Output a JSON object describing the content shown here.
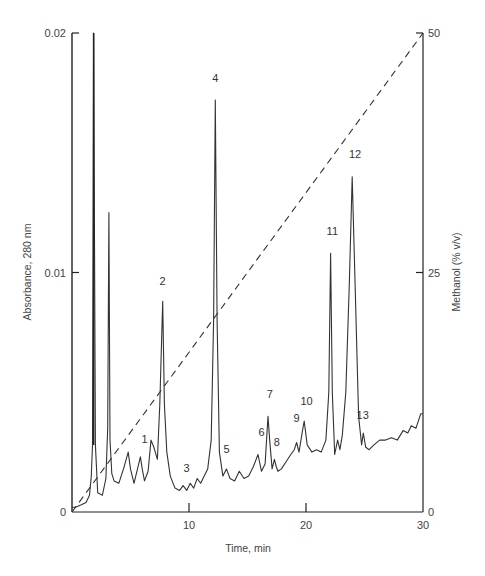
{
  "chart_data": {
    "type": "line",
    "title": "",
    "xlabel": "Time, min",
    "ylabel": "Absorbance, 280 nm",
    "y2label": "Methanol (% v/v)",
    "xlim": [
      0,
      30
    ],
    "ylim": [
      0,
      0.02
    ],
    "y2lim": [
      0,
      50
    ],
    "grid": false,
    "x_ticks": [
      {
        "value": 10,
        "label": "10"
      },
      {
        "value": 20,
        "label": "20"
      },
      {
        "value": 30,
        "label": "30"
      }
    ],
    "y_ticks": [
      {
        "value": 0,
        "label": "0"
      },
      {
        "value": 0.01,
        "label": "0.01"
      },
      {
        "value": 0.02,
        "label": "0.02"
      }
    ],
    "y2_ticks": [
      {
        "value": 0,
        "label": "0"
      },
      {
        "value": 25,
        "label": "25"
      },
      {
        "value": 50,
        "label": "50"
      }
    ],
    "series": [
      {
        "name": "Absorbance 280 nm",
        "style": "solid",
        "axis": "left",
        "x": [
          0,
          0.3,
          0.8,
          1.2,
          1.5,
          1.65,
          1.75,
          1.85,
          2.0,
          2.2,
          2.6,
          2.9,
          3.05,
          3.15,
          3.25,
          3.4,
          3.6,
          4.0,
          4.4,
          4.8,
          5.0,
          5.3,
          5.6,
          5.85,
          6.0,
          6.2,
          6.5,
          6.75,
          7.0,
          7.3,
          7.5,
          7.75,
          7.9,
          8.1,
          8.4,
          8.8,
          9.2,
          9.5,
          9.8,
          10.1,
          10.4,
          10.7,
          11.0,
          11.3,
          11.6,
          11.9,
          12.1,
          12.25,
          12.4,
          12.6,
          12.9,
          13.2,
          13.5,
          13.9,
          14.3,
          14.7,
          15.1,
          15.5,
          15.9,
          16.2,
          16.5,
          16.75,
          16.9,
          17.1,
          17.3,
          17.45,
          17.6,
          17.9,
          18.3,
          18.7,
          19.0,
          19.2,
          19.4,
          19.7,
          19.85,
          20.1,
          20.5,
          20.9,
          21.3,
          21.7,
          21.95,
          22.1,
          22.25,
          22.45,
          22.7,
          22.9,
          23.1,
          23.4,
          23.7,
          23.95,
          24.2,
          24.5,
          24.75,
          24.9,
          25.1,
          25.4,
          25.8,
          26.3,
          26.8,
          27.3,
          27.8,
          28.3,
          28.7,
          29.0,
          29.4,
          29.8,
          30.0
        ],
        "values": [
          0.0002,
          0.0002,
          0.0003,
          0.0004,
          0.0007,
          0.0015,
          0.0028,
          0.02,
          0.0028,
          0.0008,
          0.0007,
          0.0014,
          0.0035,
          0.0125,
          0.003,
          0.0016,
          0.0013,
          0.0012,
          0.0018,
          0.0025,
          0.0018,
          0.0012,
          0.0018,
          0.0023,
          0.0018,
          0.0013,
          0.0017,
          0.003,
          0.0027,
          0.0022,
          0.0045,
          0.0088,
          0.0045,
          0.0025,
          0.0015,
          0.001,
          0.0009,
          0.0011,
          0.0009,
          0.0012,
          0.001,
          0.0014,
          0.0012,
          0.0015,
          0.0018,
          0.003,
          0.008,
          0.0172,
          0.008,
          0.0025,
          0.0015,
          0.0018,
          0.0014,
          0.0013,
          0.0017,
          0.0014,
          0.0015,
          0.0019,
          0.0024,
          0.0017,
          0.002,
          0.004,
          0.003,
          0.0018,
          0.0022,
          0.0019,
          0.0017,
          0.0018,
          0.0021,
          0.0024,
          0.0026,
          0.0029,
          0.0025,
          0.0034,
          0.0038,
          0.0028,
          0.0025,
          0.0026,
          0.0025,
          0.003,
          0.005,
          0.0108,
          0.005,
          0.0024,
          0.003,
          0.0026,
          0.0032,
          0.005,
          0.0095,
          0.014,
          0.0095,
          0.004,
          0.0028,
          0.0033,
          0.0027,
          0.0026,
          0.0028,
          0.003,
          0.003,
          0.0031,
          0.003,
          0.0034,
          0.0033,
          0.0036,
          0.0035,
          0.0041,
          0.0041
        ]
      },
      {
        "name": "Methanol gradient",
        "style": "dashed",
        "axis": "right",
        "x": [
          0,
          30
        ],
        "values": [
          0,
          50
        ]
      }
    ],
    "annotations": [
      {
        "label": "1",
        "x": 6.2,
        "y": 0.0027
      },
      {
        "label": "2",
        "x": 7.75,
        "y": 0.0093
      },
      {
        "label": "3",
        "x": 9.8,
        "y": 0.0015
      },
      {
        "label": "4",
        "x": 12.25,
        "y": 0.0178
      },
      {
        "label": "5",
        "x": 13.2,
        "y": 0.0023
      },
      {
        "label": "6",
        "x": 16.2,
        "y": 0.003
      },
      {
        "label": "7",
        "x": 16.9,
        "y": 0.0046
      },
      {
        "label": "8",
        "x": 17.5,
        "y": 0.0026
      },
      {
        "label": "9",
        "x": 19.2,
        "y": 0.0036
      },
      {
        "label": "10",
        "x": 20.05,
        "y": 0.0043
      },
      {
        "label": "11",
        "x": 22.25,
        "y": 0.0114
      },
      {
        "label": "12",
        "x": 24.2,
        "y": 0.0146
      },
      {
        "label": "13",
        "x": 24.85,
        "y": 0.0037
      }
    ],
    "off_scale_peak_x": 1.85
  }
}
